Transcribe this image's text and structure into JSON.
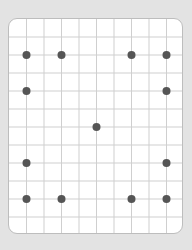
{
  "grid": {
    "columns": 10,
    "rows": 12,
    "card_width": 175,
    "card_height": 216,
    "background_color": "#e3e3e3",
    "card_color": "#ffffff",
    "card_border_color": "#bdbdbd",
    "line_color": "#cfcfcf",
    "dot_color": "#555555",
    "dot_radius": 4
  },
  "dots": [
    {
      "col": 1,
      "row": 2
    },
    {
      "col": 3,
      "row": 2
    },
    {
      "col": 7,
      "row": 2
    },
    {
      "col": 9,
      "row": 2
    },
    {
      "col": 1,
      "row": 4
    },
    {
      "col": 9,
      "row": 4
    },
    {
      "col": 5,
      "row": 6
    },
    {
      "col": 1,
      "row": 8
    },
    {
      "col": 9,
      "row": 8
    },
    {
      "col": 1,
      "row": 10
    },
    {
      "col": 3,
      "row": 10
    },
    {
      "col": 7,
      "row": 10
    },
    {
      "col": 9,
      "row": 10
    }
  ]
}
